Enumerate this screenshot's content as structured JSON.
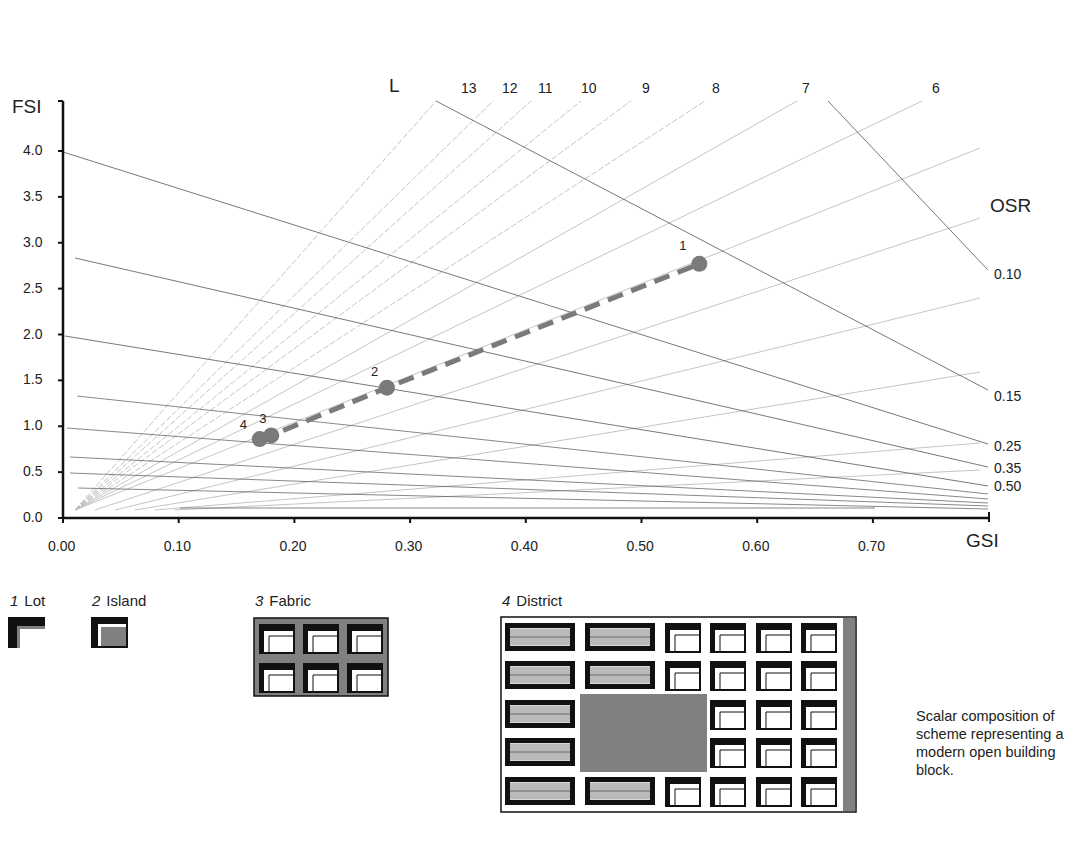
{
  "chart_data": {
    "type": "scatter",
    "title": "",
    "xlabel": "GSI",
    "ylabel": "FSI",
    "xlim": [
      0,
      0.8
    ],
    "ylim": [
      0,
      4.4
    ],
    "x_ticks": [
      "0.00",
      "0.10",
      "0.20",
      "0.30",
      "0.40",
      "0.50",
      "0.60",
      "0.70"
    ],
    "y_ticks": [
      "0.0",
      "0.5",
      "1.0",
      "1.5",
      "2.0",
      "2.5",
      "3.0",
      "3.5",
      "4.0"
    ],
    "grid": false,
    "series": [
      {
        "name": "Scalar composition (dashed trend)",
        "style": "dashed-line-with-markers",
        "color": "#7a7a7a",
        "points": [
          {
            "label": "1",
            "gsi": 0.55,
            "fsi": 2.77
          },
          {
            "label": "2",
            "gsi": 0.28,
            "fsi": 1.42
          },
          {
            "label": "3",
            "gsi": 0.18,
            "fsi": 0.9
          },
          {
            "label": "4",
            "gsi": 0.17,
            "fsi": 0.86
          }
        ]
      }
    ],
    "reference_lines": {
      "L": {
        "title": "L",
        "labels": [
          "13",
          "12",
          "11",
          "10",
          "9",
          "8",
          "7",
          "6"
        ],
        "values": [
          13,
          12,
          11,
          10,
          9,
          8,
          7,
          6
        ],
        "note": "Radiating lines of constant layers (FSI = L × GSI)"
      },
      "OSR": {
        "title": "OSR",
        "labels": [
          "0.10",
          "0.15",
          "0.25",
          "0.35",
          "0.50"
        ],
        "values": [
          0.1,
          0.15,
          0.25,
          0.35,
          0.5
        ],
        "note": "Curves of constant open space ratio"
      }
    }
  },
  "axes": {
    "y_title": "FSI",
    "x_title": "GSI",
    "l_title": "L",
    "osr_title": "OSR"
  },
  "legend": [
    {
      "num": "1",
      "label": "Lot"
    },
    {
      "num": "2",
      "label": "Island"
    },
    {
      "num": "3",
      "label": "Fabric"
    },
    {
      "num": "4",
      "label": "District"
    }
  ],
  "caption": "Scalar composition of scheme representing a modern open building block.",
  "colors": {
    "axis": "#111111",
    "fine_line": "#555555",
    "light_line": "#b5b5b5",
    "marker": "#7a7a7a",
    "block_fill": "#808080",
    "building": "#111111"
  }
}
